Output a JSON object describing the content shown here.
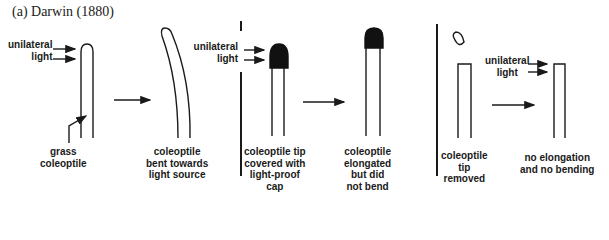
{
  "title": "(a) Darwin (1880)",
  "colors": {
    "ink": "#1a1a1a",
    "background": "#ffffff"
  },
  "panels": [
    {
      "id": "intact",
      "light_label": [
        "unilateral",
        "light"
      ],
      "before_label": [
        "grass",
        "coleoptile"
      ],
      "after_label": [
        "coleoptile",
        "bent towards",
        "light source"
      ]
    },
    {
      "id": "capped",
      "light_label": [
        "unilateral",
        "light"
      ],
      "before_label": [
        "coleoptile tip",
        "covered with",
        "light-proof",
        "cap"
      ],
      "after_label": [
        "coleoptile",
        "elongated",
        "but did",
        "not bend"
      ]
    },
    {
      "id": "decapitated",
      "light_label": [
        "unilateral",
        "light"
      ],
      "before_label": [
        "coleoptile",
        "tip",
        "removed"
      ],
      "after_label": [
        "no elongation",
        "and no bending"
      ]
    }
  ]
}
